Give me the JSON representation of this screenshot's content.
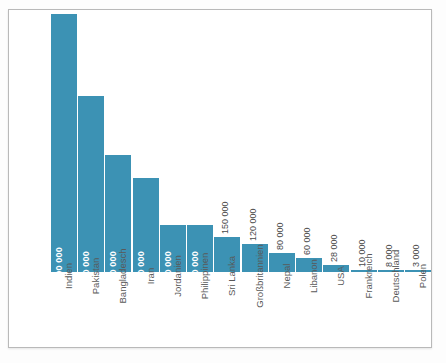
{
  "chart_data": {
    "type": "bar",
    "title": "",
    "subtitle": "",
    "xlabel": "",
    "ylabel": "",
    "grid": false,
    "legend": null,
    "orientation": "vertical",
    "bar_color": "#3c92b4",
    "inside_label_color": "#ffffff",
    "outside_label_color": "#4a4a4a",
    "category_label_color": "#595959",
    "category_label_rotation": -90,
    "value_label_rotation": -90,
    "ylim": [
      0,
      1100000
    ],
    "categories": [
      "Indien",
      "Pakistan",
      "Bangladesch",
      "Iran",
      "Jordanien",
      "Philippinen",
      "Sri Lanka",
      "Großbritannien",
      "Nepal",
      "Libanon",
      "USA",
      "Frankreich",
      "Deutschland",
      "Polen"
    ],
    "values": [
      1100000,
      750000,
      500000,
      400000,
      200000,
      200000,
      150000,
      120000,
      80000,
      60000,
      28000,
      10000,
      8000,
      3000
    ],
    "value_labels": [
      "1 100 000",
      "750 000",
      "500 000",
      "400 000",
      "200 000",
      "200 000",
      "150 000",
      "120 000",
      "80 000",
      "60 000",
      "28 000",
      "10 000",
      "8 000",
      "3 000"
    ],
    "label_placement": [
      "inside",
      "inside",
      "inside",
      "inside",
      "inside",
      "inside",
      "outside",
      "outside",
      "outside",
      "outside",
      "outside",
      "outside",
      "outside",
      "outside"
    ]
  }
}
